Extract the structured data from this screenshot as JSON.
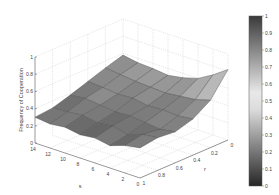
{
  "chart_data": {
    "type": "surface3d",
    "title": "",
    "xlabel": "s",
    "ylabel": "r",
    "zlabel": "Frequency of Cooperation",
    "x_ticks": [
      "0",
      "2",
      "4",
      "6",
      "8",
      "10",
      "12",
      "14"
    ],
    "y_ticks": [
      "0",
      "0.2",
      "0.4",
      "0.6",
      "0.8",
      "1"
    ],
    "z_ticks": [
      "0",
      "0.2",
      "0.4",
      "0.6",
      "0.8",
      "1"
    ],
    "xlim": [
      0,
      14
    ],
    "ylim": [
      0,
      1
    ],
    "zlim": [
      0,
      1
    ],
    "grid": true,
    "colormap": "gray (dark at extremes, light mid)",
    "colorbar": {
      "position": "right",
      "ticks": [
        "0",
        "0.1",
        "0.2",
        "0.3",
        "0.4",
        "0.5",
        "0.6",
        "0.7",
        "0.8",
        "0.9",
        "1"
      ]
    },
    "surface_description": "Rough surface with frequency of cooperation mostly between ~0.3 and ~0.5; rises toward ~0.6 near r=0 at high s and a thin ridge reaching ~0.8 near r≈0, s≈0.",
    "s_values": [
      14,
      12,
      10,
      8,
      6,
      4,
      2,
      0
    ],
    "r_values": [
      1,
      0.8,
      0.6,
      0.4,
      0.2,
      0
    ],
    "z_grid_by_s_then_r": [
      [
        0.3,
        0.32,
        0.38,
        0.45,
        0.52,
        0.58
      ],
      [
        0.28,
        0.33,
        0.4,
        0.44,
        0.5,
        0.55
      ],
      [
        0.3,
        0.35,
        0.38,
        0.42,
        0.48,
        0.54
      ],
      [
        0.27,
        0.32,
        0.36,
        0.43,
        0.47,
        0.52
      ],
      [
        0.29,
        0.34,
        0.37,
        0.4,
        0.46,
        0.55
      ],
      [
        0.26,
        0.3,
        0.35,
        0.41,
        0.48,
        0.6
      ],
      [
        0.32,
        0.36,
        0.33,
        0.4,
        0.5,
        0.7
      ],
      [
        0.35,
        0.38,
        0.36,
        0.42,
        0.55,
        0.82
      ]
    ]
  },
  "figure": {
    "colorbar_colors": {
      "top": "#3a3a3a",
      "mid": "#e6e6e6",
      "bottom": "#2a2a2a"
    },
    "surface_color": "#9a9a9a",
    "edge_color": "#4a4a4a"
  }
}
